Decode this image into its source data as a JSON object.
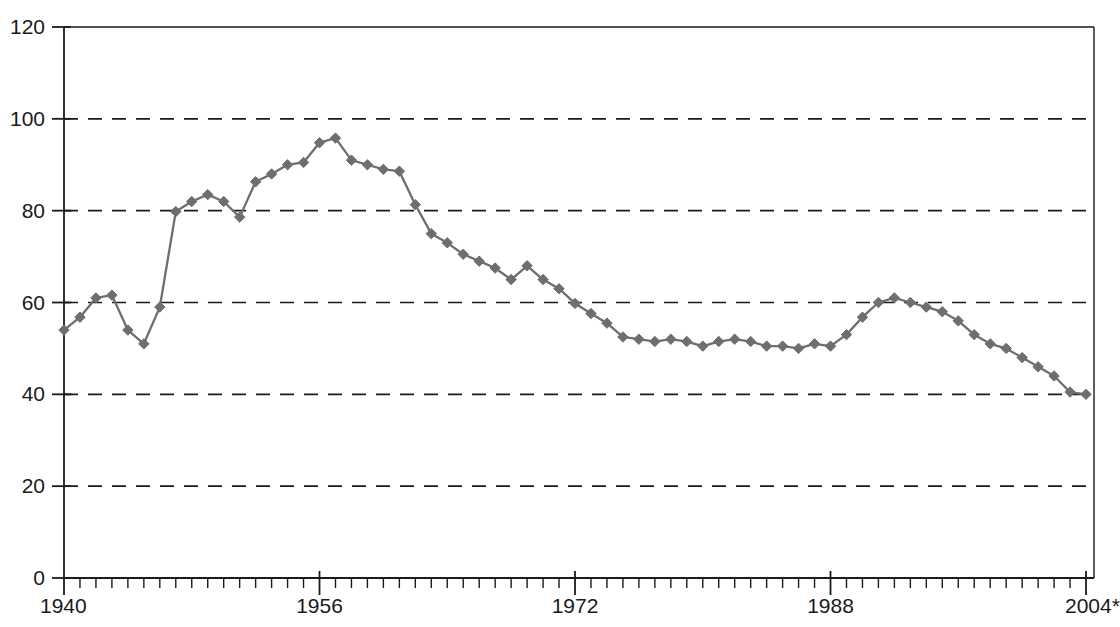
{
  "chart_data": {
    "type": "line",
    "title": "",
    "subtitle": "",
    "xlabel": "",
    "ylabel": "",
    "xlim": [
      1940,
      2004
    ],
    "ylim": [
      0,
      120
    ],
    "grid": true,
    "grid_axis": "y",
    "grid_style": "dashed",
    "legend": false,
    "legend_position": "none",
    "marker": "diamond",
    "series_color": "#6e6e6e",
    "y_ticks": [
      0,
      20,
      40,
      60,
      80,
      100,
      120
    ],
    "y_tick_labels": [
      "0",
      "20",
      "40",
      "60",
      "80",
      "100",
      "120"
    ],
    "x_major_ticks": [
      1940,
      1956,
      1972,
      1988,
      2004
    ],
    "x_major_tick_labels": [
      "1940",
      "1956",
      "1972",
      "1988",
      "2004*"
    ],
    "x_minor_tick_interval": 1,
    "x": [
      1940,
      1941,
      1942,
      1943,
      1944,
      1945,
      1946,
      1947,
      1948,
      1949,
      1950,
      1951,
      1952,
      1953,
      1954,
      1955,
      1956,
      1957,
      1958,
      1959,
      1960,
      1961,
      1962,
      1963,
      1964,
      1965,
      1966,
      1967,
      1968,
      1969,
      1970,
      1971,
      1972,
      1973,
      1974,
      1975,
      1976,
      1977,
      1978,
      1979,
      1980,
      1981,
      1982,
      1983,
      1984,
      1985,
      1986,
      1987,
      1988,
      1989,
      1990,
      1991,
      1992,
      1993,
      1994,
      1995,
      1996,
      1997,
      1998,
      1999,
      2000,
      2001,
      2002,
      2003,
      2004
    ],
    "values": [
      54.0,
      56.8,
      61.0,
      61.6,
      54.0,
      51.0,
      59.0,
      79.8,
      82.0,
      83.5,
      82.0,
      78.6,
      86.3,
      88.0,
      90.0,
      90.5,
      94.8,
      95.8,
      91.0,
      90.0,
      89.0,
      88.6,
      81.3,
      75.0,
      73.0,
      70.5,
      69.0,
      67.5,
      65.0,
      68.0,
      65.0,
      63.0,
      59.8,
      57.6,
      55.5,
      52.5,
      52.0,
      51.5,
      52.0,
      51.5,
      50.5,
      51.5,
      52.0,
      51.5,
      50.5,
      50.5,
      50.0,
      51.0,
      50.5,
      53.0,
      56.8,
      60.0,
      61.0,
      60.0,
      59.0,
      58.0,
      56.0,
      53.0,
      51.0,
      50.0,
      48.0,
      46.0,
      44.0,
      40.5,
      40.0
    ],
    "series": [
      {
        "name": "rate",
        "color": "#6e6e6e",
        "values": [
          54.0,
          56.8,
          61.0,
          61.6,
          54.0,
          51.0,
          59.0,
          79.8,
          82.0,
          83.5,
          82.0,
          78.6,
          86.3,
          88.0,
          90.0,
          90.5,
          94.8,
          95.8,
          91.0,
          90.0,
          89.0,
          88.6,
          81.3,
          75.0,
          73.0,
          70.5,
          69.0,
          67.5,
          65.0,
          68.0,
          65.0,
          63.0,
          59.8,
          57.6,
          55.5,
          52.5,
          52.0,
          51.5,
          52.0,
          51.5,
          50.5,
          51.5,
          52.0,
          51.5,
          50.5,
          50.5,
          50.0,
          51.0,
          50.5,
          53.0,
          56.8,
          60.0,
          61.0,
          60.0,
          59.0,
          58.0,
          56.0,
          53.0,
          51.0,
          50.0,
          48.0,
          46.0,
          44.0,
          40.5,
          40.0
        ]
      }
    ],
    "annotations": [],
    "colors": {
      "axis": "#1a1a1a",
      "grid": "#1a1a1a",
      "series": "#6e6e6e",
      "background": "#ffffff",
      "text": "#1a1a1a"
    }
  }
}
